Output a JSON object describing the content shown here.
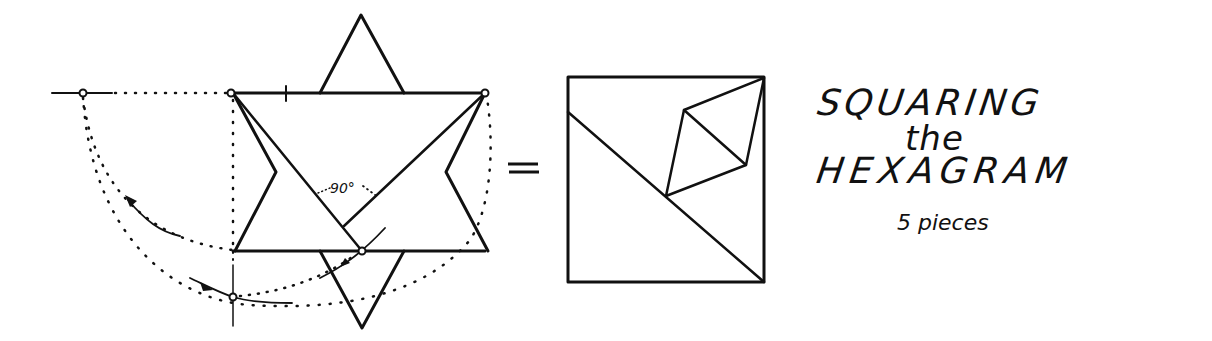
{
  "title": {
    "line1": "SQUARING",
    "line2": "the",
    "line3": "HEXAGRAM",
    "subtitle": "5 pieces"
  },
  "annotations": {
    "angle_label": "90°",
    "equals": "="
  },
  "colors": {
    "ink": "#111111",
    "background": "#ffffff"
  },
  "diagram": {
    "left_figure": "hexagram dissection with construction arcs",
    "right_figure": "square composed of 5 pieces"
  }
}
